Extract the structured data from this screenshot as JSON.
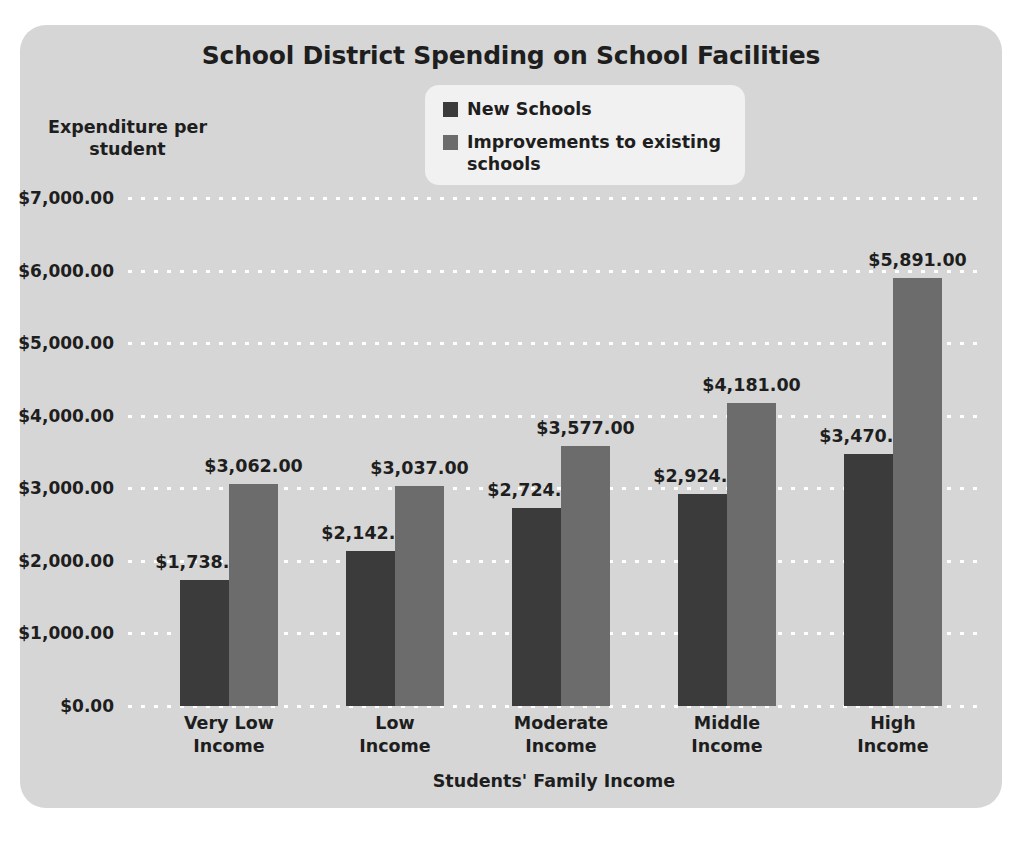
{
  "chart_data": {
    "type": "bar",
    "title": "School District Spending on School Facilities",
    "xlabel": "Students' Family Income",
    "ylabel": "Expenditure per student",
    "categories": [
      "Very Low Income",
      "Low Income",
      "Moderate Income",
      "Middle Income",
      "High Income"
    ],
    "series": [
      {
        "name": "New Schools",
        "color": "#3b3b3b",
        "values": [
          1738,
          2142,
          2724,
          2924,
          3470
        ],
        "labels": [
          "$1,738.00",
          "$2,142.00",
          "$2,724.00",
          "$2,924.00",
          "$3,470.00"
        ]
      },
      {
        "name": "Improvements to existing schools",
        "color": "#6c6c6c",
        "values": [
          3062,
          3037,
          3577,
          4181,
          5891
        ],
        "labels": [
          "$3,062.00",
          "$3,037.00",
          "$3,577.00",
          "$4,181.00",
          "$5,891.00"
        ]
      }
    ],
    "ylim": [
      0,
      7000
    ],
    "ytick_values": [
      0,
      1000,
      2000,
      3000,
      4000,
      5000,
      6000,
      7000
    ],
    "ytick_labels": [
      "$0.00",
      "$1,000.00",
      "$2,000.00",
      "$3,000.00",
      "$4,000.00",
      "$5,000.00",
      "$6,000.00",
      "$7,000.00"
    ],
    "grid": true,
    "grid_style": "white dotted horizontal",
    "legend_position": "top-center",
    "panel_color": "#d6d6d6",
    "legend_background": "#f1f1f1",
    "text_color": "#1e1e1e"
  },
  "y_axis_title_lines": [
    "Expenditure per",
    "student"
  ],
  "category_lines": [
    [
      "Very Low",
      "Income"
    ],
    [
      "Low",
      "Income"
    ],
    [
      "Moderate",
      "Income"
    ],
    [
      "Middle",
      "Income"
    ],
    [
      "High",
      "Income"
    ]
  ]
}
